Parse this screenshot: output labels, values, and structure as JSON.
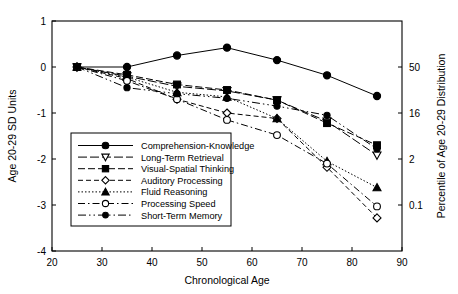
{
  "chart_data": {
    "type": "line",
    "title": "",
    "xlabel": "Chronological Age",
    "ylabel": "Age 20-29 SD Units",
    "y2label": "Percentile of Age 20-29 Distribution",
    "x": [
      25,
      35,
      45,
      55,
      65,
      75,
      85
    ],
    "xlim": [
      20,
      90
    ],
    "ylim": [
      -4,
      1
    ],
    "xticks": [
      20,
      30,
      40,
      50,
      60,
      70,
      80,
      90
    ],
    "xticklabels": [
      "20",
      "30",
      "40",
      "50",
      "60",
      "70",
      "80",
      "90"
    ],
    "yticks": [
      1,
      0,
      -1,
      -2,
      -3,
      -4
    ],
    "yticklabels": [
      "1",
      "0",
      "-1",
      "-2",
      "-3",
      "-4"
    ],
    "y2ticks": [
      0,
      -1,
      -2,
      -3
    ],
    "y2ticklabels": [
      "50",
      "16",
      "2",
      "0.1"
    ],
    "grid": false,
    "legend_position": "lower-left-inside",
    "series": [
      {
        "name": "Comprehension-Knowledge",
        "marker": "filled-circle",
        "dash": "solid",
        "values": [
          0.0,
          0.0,
          0.25,
          0.42,
          0.15,
          -0.18,
          -0.63
        ]
      },
      {
        "name": "Long-Term Retrieval",
        "marker": "open-triangle-down",
        "dash": "long-dash",
        "values": [
          0.0,
          -0.2,
          -0.42,
          -0.52,
          -0.72,
          -1.18,
          -1.92
        ]
      },
      {
        "name": "Visual-Spatial Thinking",
        "marker": "filled-square",
        "dash": "dash-long",
        "values": [
          0.0,
          -0.17,
          -0.38,
          -0.5,
          -0.72,
          -1.22,
          -1.7
        ]
      },
      {
        "name": "Auditory Processing",
        "marker": "open-diamond",
        "dash": "dashed",
        "values": [
          0.0,
          -0.25,
          -0.7,
          -1.0,
          -1.12,
          -2.18,
          -3.28
        ]
      },
      {
        "name": "Fluid Reasoning",
        "marker": "filled-triangle-up",
        "dash": "dotted",
        "values": [
          0.0,
          -0.22,
          -0.55,
          -0.65,
          -1.12,
          -2.05,
          -2.62
        ]
      },
      {
        "name": "Processing Speed",
        "marker": "open-circle",
        "dash": "dash-dot",
        "values": [
          0.0,
          -0.3,
          -0.7,
          -1.15,
          -1.48,
          -2.1,
          -3.03
        ]
      },
      {
        "name": "Short-Term Memory",
        "marker": "filled-circle-small",
        "dash": "dash-dot-dot",
        "values": [
          0.0,
          -0.45,
          -0.58,
          -0.68,
          -0.85,
          -1.05,
          -1.78
        ]
      }
    ]
  }
}
